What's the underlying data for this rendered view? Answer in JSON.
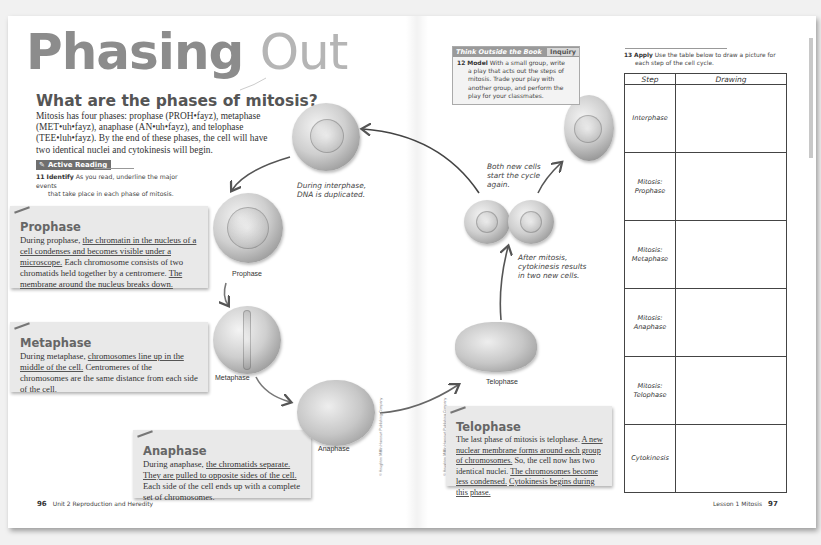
{
  "left_page": {
    "title_bold": "Phasing",
    "title_light": "Out",
    "question_heading": "What are the phases of mitosis?",
    "intro": "Mitosis has four phases: prophase (PROH•fayz), metaphase (MET•uh•fayz), anaphase (AN•uh•fayz), and telophase (TEE•luh•fayz). By the end of these phases, the cell will have two identical nuclei and cytokinesis will begin.",
    "active_reading": {
      "badge": "Active Reading",
      "item_number": "11",
      "item_label": "Identify",
      "item_text_1": "As you read, underline the major events",
      "item_text_2": "that take place in each phase of mitosis."
    },
    "phases": [
      {
        "title": "Prophase",
        "parts": [
          {
            "text": "During prophase, ",
            "u": false
          },
          {
            "text": "the chromatin in the nucleus of a cell condenses and becomes visible under a microscope.",
            "u": true
          },
          {
            "text": " Each chromosome consists of two chromatids held together by a centromere. ",
            "u": false
          },
          {
            "text": "The membrane around the nucleus breaks down.",
            "u": true
          }
        ]
      },
      {
        "title": "Metaphase",
        "parts": [
          {
            "text": "During metaphase, ",
            "u": false
          },
          {
            "text": "chromosomes line up in the middle of the cell.",
            "u": true
          },
          {
            "text": " Centromeres of the chromosomes are the same distance from each side of the cell.",
            "u": false
          }
        ]
      },
      {
        "title": "Anaphase",
        "parts": [
          {
            "text": "During anaphase, ",
            "u": false
          },
          {
            "text": "the chromatids separate. They are pulled to opposite sides of the cell.",
            "u": true
          },
          {
            "text": " Each side of the cell ends up with a complete set of chromosomes.",
            "u": false
          }
        ]
      }
    ],
    "footer": {
      "page_number": "96",
      "unit": "Unit 2 Reproduction and Heredity"
    }
  },
  "diagram": {
    "labels": {
      "prophase": "Prophase",
      "metaphase": "Metaphase",
      "anaphase": "Anaphase",
      "telophase": "Telophase"
    },
    "notes": {
      "interphase_1": "During interphase,",
      "interphase_2": "DNA is duplicated.",
      "restart_1": "Both new cells",
      "restart_2": "start the cycle",
      "restart_3": "again.",
      "cytokinesis_1": "After mitosis,",
      "cytokinesis_2": "cytokinesis results",
      "cytokinesis_3": "in two new cells."
    },
    "copyright": "© Houghton Mifflin Harcourt Publishing Company"
  },
  "right_page": {
    "think_outside": {
      "header": "Think Outside the Book",
      "tag": "Inquiry",
      "item_number": "12",
      "item_label": "Model",
      "line_1": "With a small group, write",
      "line_rest": "a play that acts out the steps of mitosis. Trade your play with another group, and perform the play for your classmates."
    },
    "telophase_box": {
      "title": "Telophase",
      "parts": [
        {
          "text": "The last phase of mitosis is telophase. ",
          "u": false
        },
        {
          "text": "A new nuclear membrane forms around each group of chromosomes.",
          "u": true
        },
        {
          "text": " So, the cell now has two identical nuclei. ",
          "u": false
        },
        {
          "text": "The chromosomes become less condensed.",
          "u": true
        },
        {
          "text": " ",
          "u": false
        },
        {
          "text": "Cytokinesis begins during this phase.",
          "u": true
        }
      ]
    },
    "apply": {
      "item_number": "13",
      "item_label": "Apply",
      "line_1": "Use the table below to draw a picture for",
      "line_2": "each step of the cell cycle."
    },
    "table": {
      "headers": [
        "Step",
        "Drawing"
      ],
      "rows": [
        {
          "step_1": "Interphase",
          "step_2": ""
        },
        {
          "step_1": "Mitosis:",
          "step_2": "Prophase"
        },
        {
          "step_1": "Mitosis:",
          "step_2": "Metaphase"
        },
        {
          "step_1": "Mitosis:",
          "step_2": "Anaphase"
        },
        {
          "step_1": "Mitosis:",
          "step_2": "Telophase"
        },
        {
          "step_1": "Cytokinesis",
          "step_2": ""
        }
      ]
    },
    "footer": {
      "lesson": "Lesson 1 Mitosis",
      "page_number": "97"
    }
  }
}
